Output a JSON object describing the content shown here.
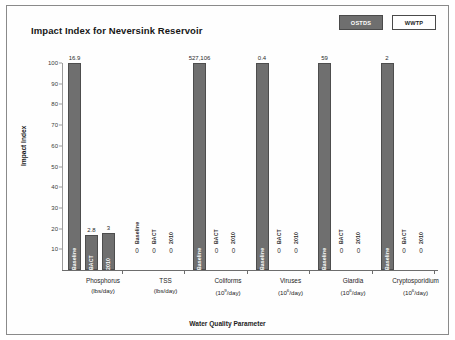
{
  "chart": {
    "title": "Impact Index for Neversink Reservoir",
    "xlabel": "Water Quality Parameter",
    "ylabel": "Impact Index"
  },
  "legend": {
    "items": [
      {
        "label": "OSTDS",
        "style": "dark",
        "color": "#6f6f6f"
      },
      {
        "label": "WWTP",
        "style": "light",
        "color": "#ffffff"
      }
    ]
  },
  "yticks": [
    "100",
    "90",
    "80",
    "70",
    "60",
    "50",
    "40",
    "30",
    "20",
    "10"
  ],
  "chart_data": {
    "type": "bar",
    "title": "Impact Index for Neversink Reservoir",
    "xlabel": "Water Quality Parameter",
    "ylabel": "Impact Index",
    "ylim": [
      0,
      100
    ],
    "grid": false,
    "legend": [
      "OSTDS",
      "WWTP"
    ],
    "legend_position": "top-right",
    "series_labels": [
      "Baseline",
      "BACT",
      "2010"
    ],
    "categories": [
      {
        "name": "Phosphorus",
        "unit_prefix": "(lbs/day)",
        "unit_exp": ""
      },
      {
        "name": "TSS",
        "unit_prefix": "(lbs/day)",
        "unit_exp": ""
      },
      {
        "name": "Coliforms",
        "unit_prefix": "(10",
        "unit_exp": "9",
        "unit_suffix": "/day)"
      },
      {
        "name": "Viruses",
        "unit_prefix": "(10",
        "unit_exp": "6",
        "unit_suffix": "/day)"
      },
      {
        "name": "Giardia",
        "unit_prefix": "(10",
        "unit_exp": "6",
        "unit_suffix": "/day)"
      },
      {
        "name": "Cryptosporidium",
        "unit_prefix": "(10",
        "unit_exp": "6",
        "unit_suffix": "/day)"
      }
    ],
    "bars": [
      {
        "category": "Phosphorus",
        "series": "Baseline",
        "value": 100,
        "annotation": "16.9"
      },
      {
        "category": "Phosphorus",
        "series": "BACT",
        "value": 17,
        "annotation": "2.8"
      },
      {
        "category": "Phosphorus",
        "series": "2010",
        "value": 18,
        "annotation": "3"
      },
      {
        "category": "TSS",
        "series": "Baseline",
        "value": 0,
        "annotation": "0"
      },
      {
        "category": "TSS",
        "series": "BACT",
        "value": 0,
        "annotation": "0"
      },
      {
        "category": "TSS",
        "series": "2010",
        "value": 0,
        "annotation": "0"
      },
      {
        "category": "Coliforms",
        "series": "Baseline",
        "value": 100,
        "annotation": "527,106"
      },
      {
        "category": "Coliforms",
        "series": "BACT",
        "value": 0,
        "annotation": "0"
      },
      {
        "category": "Coliforms",
        "series": "2010",
        "value": 0,
        "annotation": "0"
      },
      {
        "category": "Viruses",
        "series": "Baseline",
        "value": 100,
        "annotation": "0.4"
      },
      {
        "category": "Viruses",
        "series": "BACT",
        "value": 0,
        "annotation": "0"
      },
      {
        "category": "Viruses",
        "series": "2010",
        "value": 0,
        "annotation": "0"
      },
      {
        "category": "Giardia",
        "series": "Baseline",
        "value": 100,
        "annotation": "59"
      },
      {
        "category": "Giardia",
        "series": "BACT",
        "value": 0,
        "annotation": "0"
      },
      {
        "category": "Giardia",
        "series": "2010",
        "value": 0,
        "annotation": "0"
      },
      {
        "category": "Cryptosporidium",
        "series": "Baseline",
        "value": 100,
        "annotation": "2"
      },
      {
        "category": "Cryptosporidium",
        "series": "BACT",
        "value": 0,
        "annotation": "0"
      },
      {
        "category": "Cryptosporidium",
        "series": "2010",
        "value": 0,
        "annotation": "0"
      }
    ]
  }
}
